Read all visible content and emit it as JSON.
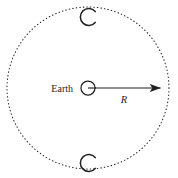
{
  "figure": {
    "background_color": "#ffffff",
    "stroke_color": "#231f20",
    "width": 178,
    "height": 178
  },
  "labels": {
    "earth": "Earth",
    "radius": "R"
  },
  "elements": {
    "orbit": {
      "name": "dotted-orbit-circle",
      "style": "dotted",
      "center_x": 88,
      "center_y": 88,
      "radius": 81
    },
    "earth_symbol": {
      "name": "earth-circle-symbol",
      "center_x": 88,
      "center_y": 88,
      "radius": 7
    },
    "radius_arrow": {
      "name": "radius-arrow",
      "from_x": 88,
      "from_y": 88,
      "to_x": 169,
      "to_y": 88
    },
    "moon_top": {
      "name": "moon-crescent-top",
      "center_x": 90,
      "center_y": 17,
      "radius": 8
    },
    "moon_bottom": {
      "name": "moon-crescent-bottom",
      "center_x": 90,
      "center_y": 163,
      "radius": 8
    }
  }
}
